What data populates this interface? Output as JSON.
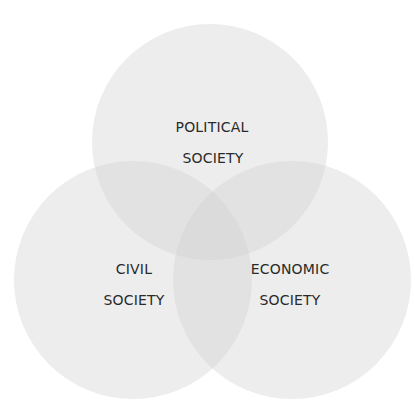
{
  "diagram": {
    "type": "venn",
    "circles": [
      {
        "id": "political",
        "label_line1": "POLITICAL",
        "label_line2": "SOCIETY",
        "cx": 210,
        "cy": 142,
        "r": 118
      },
      {
        "id": "civil",
        "label_line1": "CIVIL",
        "label_line2": "SOCIETY",
        "cx": 133,
        "cy": 280,
        "r": 119
      },
      {
        "id": "economic",
        "label_line1": "ECONOMIC",
        "label_line2": "SOCIETY",
        "cx": 292,
        "cy": 280,
        "r": 119
      }
    ],
    "colors": {
      "fill": "#cfcfcf",
      "fill_opacity": 0.38,
      "text": "#2a2a2a",
      "background": "#ffffff"
    }
  }
}
